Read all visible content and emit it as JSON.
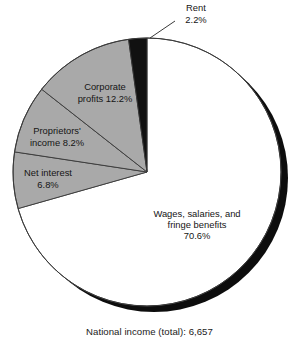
{
  "chart_data": {
    "type": "pie",
    "title": "",
    "subtitle": "",
    "caption": "National income (total): 6,657",
    "total_label": "National income (total)",
    "total_value": "6,657",
    "units": "percent of national income",
    "legend_position": "none",
    "labels_inline": true,
    "start_angle_deg": 0,
    "direction": "clockwise",
    "categories": [
      "Wages, salaries, and fringe benefits",
      "Net interest",
      "Proprietors' income",
      "Corporate profits",
      "Rent"
    ],
    "values": [
      70.6,
      6.8,
      8.2,
      12.2,
      2.2
    ],
    "slices": [
      {
        "name": "wages-salaries-fringe-benefits",
        "lines": [
          "Wages, salaries, and",
          "fringe benefits",
          "70.6%"
        ],
        "value": 70.6,
        "value_label": "70.6%",
        "color": "#ffffff",
        "label_x": 197,
        "label_y": 226,
        "leader": false
      },
      {
        "name": "net-interest",
        "lines": [
          "Net interest",
          "6.8%"
        ],
        "value": 6.8,
        "value_label": "6.8%",
        "color": "#a9a9a9",
        "label_x": 48,
        "label_y": 180,
        "leader": false
      },
      {
        "name": "proprietors-income",
        "lines": [
          "Proprietors'",
          "income 8.2%"
        ],
        "value": 8.2,
        "value_label": "8.2%",
        "color": "#a9a9a9",
        "label_x": 57,
        "label_y": 138,
        "leader": false
      },
      {
        "name": "corporate-profits",
        "lines": [
          "Corporate",
          "profits 12.2%"
        ],
        "value": 12.2,
        "value_label": "12.2%",
        "color": "#a9a9a9",
        "label_x": 105,
        "label_y": 94,
        "leader": false
      },
      {
        "name": "rent",
        "lines": [
          "Rent",
          "2.2%"
        ],
        "value": 2.2,
        "value_label": "2.2%",
        "color": "#111111",
        "label_x": 196,
        "label_y": 15,
        "leader": true
      }
    ],
    "colors": {
      "slice_white": "#ffffff",
      "slice_gray": "#a9a9a9",
      "slice_black": "#111111",
      "outline": "#3a3a3a",
      "shadow": "#0d0d0d",
      "text": "#1a1a1a",
      "background": "#ffffff"
    },
    "geometry": {
      "center_x": 147,
      "center_y": 172,
      "radius": 134,
      "shadow_offset_x": 7,
      "shadow_offset_y": 6
    }
  }
}
